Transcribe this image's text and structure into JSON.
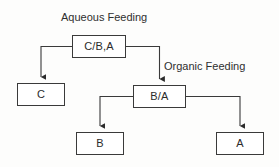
{
  "diagram": {
    "title_label": "Aqueous Feeding",
    "secondary_label": "Organic Feeding",
    "type": "flowchart-tree",
    "background_color": "#fdfdfc",
    "line_color": "#3a3a3a",
    "text_color": "#2b2b2b",
    "nodes": [
      {
        "id": "root",
        "label": "C/B,A"
      },
      {
        "id": "c",
        "label": "C"
      },
      {
        "id": "ba",
        "label": "B/A"
      },
      {
        "id": "b",
        "label": "B"
      },
      {
        "id": "a",
        "label": "A"
      }
    ],
    "edges": [
      {
        "from": "root",
        "to": "c",
        "style": "elbow-left-down",
        "arrow": "solid-triangle"
      },
      {
        "from": "root",
        "to": "ba",
        "style": "elbow-right-down",
        "arrow": "solid-triangle"
      },
      {
        "from": "ba",
        "to": "b",
        "style": "elbow-left-down",
        "arrow": "solid-triangle"
      },
      {
        "from": "ba",
        "to": "a",
        "style": "elbow-right-down",
        "arrow": "solid-triangle"
      }
    ]
  }
}
